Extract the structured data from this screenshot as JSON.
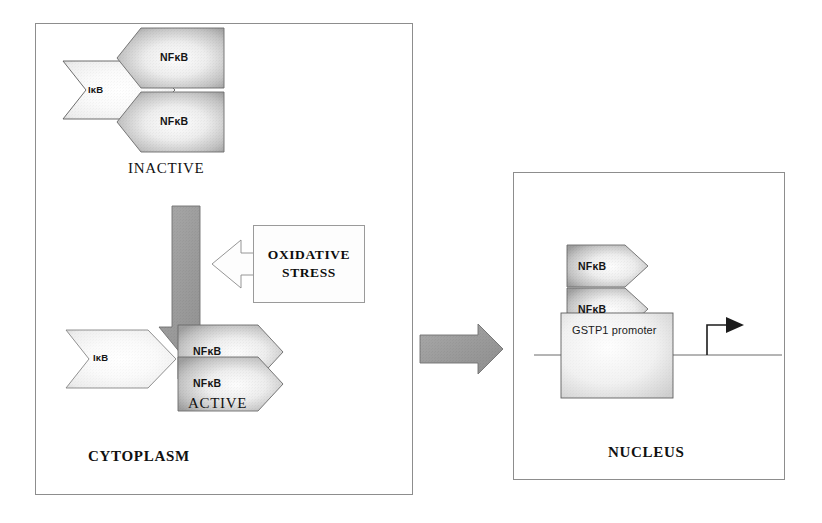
{
  "figure": {
    "colors": {
      "panel_border": "#8d8d8d",
      "arrow_gray_fill": "#9c9c9c",
      "arrow_gray_stroke": "#6f6f6f",
      "shape_fill_light": "#f7f7f7",
      "shape_fill_mid": "#b8b8b8",
      "text": "#111111",
      "dna_line": "#6a6a6a"
    }
  },
  "cytoplasm_panel": {
    "region_label": "CYTOPLASM",
    "inactive_group": {
      "state_label": "INACTIVE",
      "ikb_label": "IκB",
      "nfkb_labels": [
        "NFκB",
        "NFκB"
      ]
    },
    "active_group": {
      "state_label": "ACTIVE",
      "ikb_label": "IκB",
      "nfkb_labels": [
        "NFκB",
        "NFκB"
      ]
    },
    "activation_arrow": {
      "name": "activation-down-arrow",
      "direction": "down",
      "fill": "#9c9c9c"
    },
    "stimulus_arrow": {
      "name": "oxidative-stress-left-arrow",
      "direction": "left",
      "fill": "#fdfdfd"
    },
    "stimulus_box": {
      "line1": "OXIDATIVE",
      "line2": "STRESS"
    }
  },
  "translocation_arrow": {
    "name": "translocation-right-arrow",
    "direction": "right",
    "fill": "#9c9c9c"
  },
  "nucleus_panel": {
    "region_label": "NUCLEUS",
    "nfkb_labels": [
      "NFκB",
      "NFκB"
    ],
    "promoter_label": "GSTP1 promoter",
    "transcription_arrow": {
      "name": "transcription-start-arrow",
      "direction": "right"
    }
  }
}
